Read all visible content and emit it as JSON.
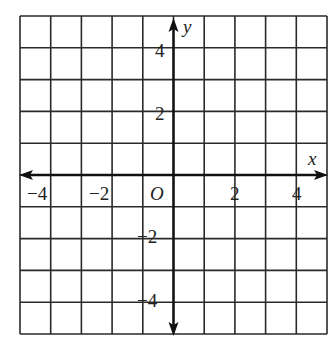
{
  "grid": {
    "left": 20,
    "top": 16,
    "right": 327,
    "bottom": 334,
    "cols": 10,
    "rows": 10,
    "line_color": "#2a2a2a",
    "axis_color": "#111111"
  },
  "axes": {
    "x_label": "x",
    "y_label": "y",
    "origin_label": "O",
    "x_ticks": [
      {
        "value": -4,
        "label": "−4"
      },
      {
        "value": -2,
        "label": "−2"
      },
      {
        "value": 2,
        "label": "2"
      },
      {
        "value": 4,
        "label": "4"
      }
    ],
    "y_ticks": [
      {
        "value": 4,
        "label": "4"
      },
      {
        "value": 2,
        "label": "2"
      },
      {
        "value": -2,
        "label": "−2"
      },
      {
        "value": -4,
        "label": "−4"
      }
    ],
    "x_range": [
      -5,
      5
    ],
    "y_range": [
      -5,
      5
    ]
  }
}
